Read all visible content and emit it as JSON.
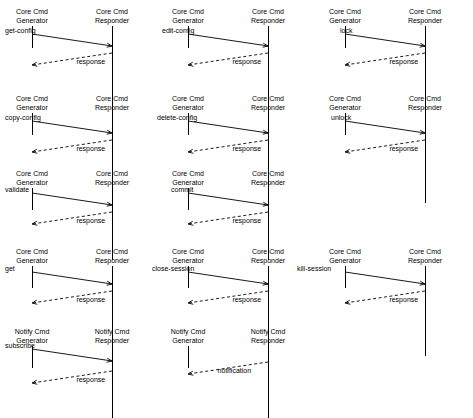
{
  "diagram": {
    "type": "sequence-diagram-grid",
    "actors": {
      "core_gen": "Core Cmd\nGenerator",
      "core_resp": "Core Cmd\nResponder",
      "notify_gen": "Notify Cmd\nGenerator",
      "notify_resp": "Notify Cmd\nResponder"
    },
    "panels": [
      {
        "id": "get-config",
        "left_actor": [
          "Core Cmd",
          "Generator"
        ],
        "right_actor": [
          "Core Cmd",
          "Responder"
        ],
        "messages": [
          {
            "label": "get-config",
            "dir": "right",
            "style": "solid"
          },
          {
            "label": "response",
            "dir": "left",
            "style": "dashed"
          }
        ]
      },
      {
        "id": "edit-config",
        "left_actor": [
          "Core Cmd",
          "Generator"
        ],
        "right_actor": [
          "Core Cmd",
          "Responder"
        ],
        "messages": [
          {
            "label": "edit-config",
            "dir": "right",
            "style": "solid"
          },
          {
            "label": "response",
            "dir": "left",
            "style": "dashed"
          }
        ]
      },
      {
        "id": "lock",
        "left_actor": [
          "Core Cmd",
          "Generator"
        ],
        "right_actor": [
          "Core Cmd",
          "Responder"
        ],
        "messages": [
          {
            "label": "lock",
            "dir": "right",
            "style": "solid"
          },
          {
            "label": "response",
            "dir": "left",
            "style": "dashed"
          }
        ]
      },
      {
        "id": "copy-config",
        "left_actor": [
          "Core Cmd",
          "Generator"
        ],
        "right_actor": [
          "Core Cmd",
          "Responder"
        ],
        "messages": [
          {
            "label": "copy-config",
            "dir": "right",
            "style": "solid"
          },
          {
            "label": "response",
            "dir": "left",
            "style": "dashed"
          }
        ]
      },
      {
        "id": "delete-config",
        "left_actor": [
          "Core Cmd",
          "Generator"
        ],
        "right_actor": [
          "Core Cmd",
          "Responder"
        ],
        "messages": [
          {
            "label": "delete-config",
            "dir": "right",
            "style": "solid"
          },
          {
            "label": "response",
            "dir": "left",
            "style": "dashed"
          }
        ]
      },
      {
        "id": "unlock",
        "left_actor": [
          "Core Cmd",
          "Generator"
        ],
        "right_actor": [
          "Core Cmd",
          "Responder"
        ],
        "messages": [
          {
            "label": "unlock",
            "dir": "right",
            "style": "solid"
          },
          {
            "label": "response",
            "dir": "left",
            "style": "dashed"
          }
        ]
      },
      {
        "id": "validate",
        "left_actor": [
          "Core Cmd",
          "Generator"
        ],
        "right_actor": [
          "Core Cmd",
          "Responder"
        ],
        "messages": [
          {
            "label": "validate",
            "dir": "right",
            "style": "solid"
          },
          {
            "label": "response",
            "dir": "left",
            "style": "dashed"
          }
        ]
      },
      {
        "id": "commit",
        "left_actor": [
          "Core Cmd",
          "Generator"
        ],
        "right_actor": [
          "Core Cmd",
          "Responder"
        ],
        "messages": [
          {
            "label": "commit",
            "dir": "right",
            "style": "solid"
          },
          {
            "label": "response",
            "dir": "left",
            "style": "dashed"
          }
        ]
      },
      {
        "id": "get",
        "left_actor": [
          "Core Cmd",
          "Generator"
        ],
        "right_actor": [
          "Core Cmd",
          "Responder"
        ],
        "messages": [
          {
            "label": "get",
            "dir": "right",
            "style": "solid"
          },
          {
            "label": "response",
            "dir": "left",
            "style": "dashed"
          }
        ]
      },
      {
        "id": "close-session",
        "left_actor": [
          "Core Cmd",
          "Generator"
        ],
        "right_actor": [
          "Core Cmd",
          "Responder"
        ],
        "messages": [
          {
            "label": "close-session",
            "dir": "right",
            "style": "solid"
          },
          {
            "label": "response",
            "dir": "left",
            "style": "dashed"
          }
        ]
      },
      {
        "id": "kill-session",
        "left_actor": [
          "Core Cmd",
          "Generator"
        ],
        "right_actor": [
          "Core Cmd",
          "Responder"
        ],
        "messages": [
          {
            "label": "kill-session",
            "dir": "right",
            "style": "solid"
          },
          {
            "label": "response",
            "dir": "left",
            "style": "dashed"
          }
        ]
      },
      {
        "id": "subscribe",
        "left_actor": [
          "Notify Cmd",
          "Generator"
        ],
        "right_actor": [
          "Notify Cmd",
          "Responder"
        ],
        "messages": [
          {
            "label": "subscribe",
            "dir": "right",
            "style": "solid"
          },
          {
            "label": "response",
            "dir": "left",
            "style": "dashed"
          }
        ]
      },
      {
        "id": "notification",
        "left_actor": [
          "Notify Cmd",
          "Generator"
        ],
        "right_actor": [
          "Notify Cmd",
          "Responder"
        ],
        "messages": [
          {
            "label": "notification",
            "dir": "left",
            "style": "dashed"
          }
        ]
      }
    ]
  }
}
